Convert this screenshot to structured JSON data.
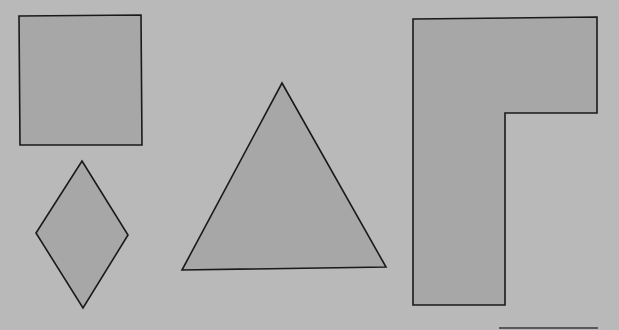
{
  "colors": {
    "background": "#b9b9b9",
    "shape_fill": "#a7a7a7",
    "stroke": "#1a1a1a"
  },
  "shapes": [
    {
      "name": "square",
      "type": "polygon",
      "points": "19,16 141,15 142,145 20,145"
    },
    {
      "name": "rhombus",
      "type": "polygon",
      "points": "82,161 128,235 83,308 36,233"
    },
    {
      "name": "triangle",
      "type": "polygon",
      "points": "282,83 386,267 182,270"
    },
    {
      "name": "l-shape",
      "type": "polygon",
      "points": "413,19 597,17 597,113 505,113 505,305 413,305"
    }
  ],
  "lines": [
    {
      "name": "baseline-segment",
      "x1": 499,
      "y1": 328,
      "x2": 598,
      "y2": 328
    }
  ]
}
